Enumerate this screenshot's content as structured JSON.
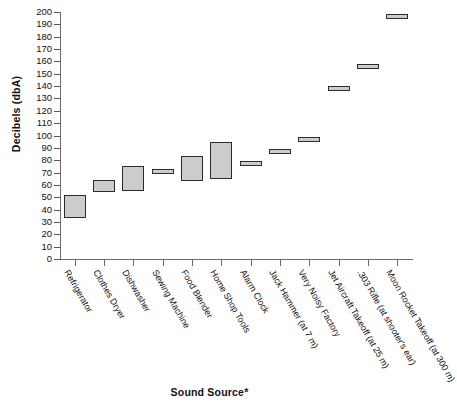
{
  "chart_data": {
    "type": "bar",
    "bar_style": "floating-range",
    "title": "",
    "xlabel": "Sound Source*",
    "ylabel": "Decibels (dbA)",
    "ylim": [
      0,
      200
    ],
    "ytick_step": 10,
    "yticks": [
      0,
      10,
      20,
      30,
      40,
      50,
      60,
      70,
      80,
      90,
      100,
      110,
      120,
      130,
      140,
      150,
      160,
      170,
      180,
      190,
      200
    ],
    "grid": false,
    "legend": "none",
    "categories": [
      "Refrigerator",
      "Clothes Dryer",
      "Dishwasher",
      "Sewing Machine",
      "Food Blender",
      "Home Shop Tools",
      "Alarm Clock",
      "Jack Hammer (at 7 m)",
      "Very Noisy Factory",
      "Jet Aircraft Takeoff (at 25 m)",
      ".303 Rifle (at shooter's ear)",
      "Moon Rocket Takeoff (at 300 m)"
    ],
    "series": [
      {
        "name": "Minimum",
        "values": [
          33,
          54,
          55,
          69,
          63,
          65,
          77,
          87,
          97,
          138,
          156,
          196
        ]
      },
      {
        "name": "Maximum",
        "values": [
          52,
          64,
          75,
          73,
          83,
          95,
          79,
          89,
          99,
          140,
          158,
          198
        ]
      }
    ],
    "ranges": [
      {
        "category": "Refrigerator",
        "min": 33,
        "max": 52
      },
      {
        "category": "Clothes Dryer",
        "min": 54,
        "max": 64
      },
      {
        "category": "Dishwasher",
        "min": 55,
        "max": 75
      },
      {
        "category": "Sewing Machine",
        "min": 69,
        "max": 73
      },
      {
        "category": "Food Blender",
        "min": 63,
        "max": 83
      },
      {
        "category": "Home Shop Tools",
        "min": 65,
        "max": 95
      },
      {
        "category": "Alarm Clock",
        "min": 77,
        "max": 79
      },
      {
        "category": "Jack Hammer (at 7 m)",
        "min": 87,
        "max": 89
      },
      {
        "category": "Very Noisy Factory",
        "min": 97,
        "max": 99
      },
      {
        "category": "Jet Aircraft Takeoff (at 25 m)",
        "min": 138,
        "max": 140
      },
      {
        "category": ".303 Rifle (at shooter's ear)",
        "min": 156,
        "max": 158
      },
      {
        "category": "Moon Rocket Takeoff (at 300 m)",
        "min": 196,
        "max": 198
      }
    ],
    "colors": {
      "bar_fill": "#cccccc",
      "bar_border": "#2b2b2b",
      "axis": "#6b6b6b",
      "text": "#111111",
      "background": "#ffffff"
    }
  }
}
